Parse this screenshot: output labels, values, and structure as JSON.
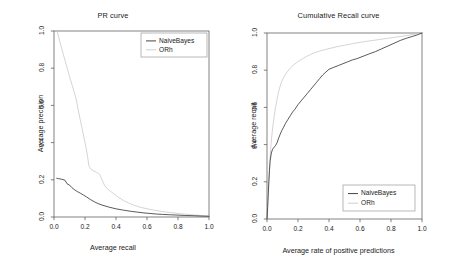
{
  "figure": {
    "background": "#ffffff",
    "panels": [
      "pr",
      "cumrecall"
    ]
  },
  "colors": {
    "naivebayes": "#303030",
    "orh": "#c9c9c9",
    "axis": "#4d4d4d",
    "text": "#1a1a1a",
    "legend_border": "#9a9a9a"
  },
  "chart_data": [
    {
      "id": "pr",
      "type": "line",
      "title": "PR curve",
      "xlabel": "Average recall",
      "ylabel": "Average precision",
      "xlim": [
        0.0,
        1.0
      ],
      "ylim": [
        0.0,
        1.0
      ],
      "xticks": [
        "0.0",
        "0.2",
        "0.4",
        "0.6",
        "0.8",
        "1.0"
      ],
      "yticks": [
        "0.0",
        "0.2",
        "0.4",
        "0.6",
        "0.8",
        "1.0"
      ],
      "grid": false,
      "legend_position": "top-right",
      "legend": [
        "NaiveBayes",
        "ORh"
      ],
      "series": [
        {
          "name": "NaiveBayes",
          "color": "#303030",
          "x": [
            0.018,
            0.03,
            0.05,
            0.07,
            0.085,
            0.1,
            0.115,
            0.13,
            0.15,
            0.17,
            0.19,
            0.21,
            0.235,
            0.26,
            0.285,
            0.31,
            0.335,
            0.36,
            0.4,
            0.44,
            0.47,
            0.5,
            0.54,
            0.58,
            0.62,
            0.66,
            0.7,
            0.75,
            0.8,
            0.85,
            0.9,
            0.95,
            1.0
          ],
          "y": [
            0.208,
            0.206,
            0.203,
            0.198,
            0.178,
            0.172,
            0.158,
            0.148,
            0.137,
            0.128,
            0.118,
            0.108,
            0.094,
            0.082,
            0.072,
            0.064,
            0.058,
            0.052,
            0.044,
            0.038,
            0.034,
            0.03,
            0.026,
            0.022,
            0.019,
            0.016,
            0.014,
            0.012,
            0.01,
            0.008,
            0.007,
            0.005,
            0.004
          ]
        },
        {
          "name": "ORh",
          "color": "#c9c9c9",
          "x": [
            0.02,
            0.04,
            0.06,
            0.08,
            0.1,
            0.12,
            0.14,
            0.16,
            0.18,
            0.2,
            0.215,
            0.225,
            0.24,
            0.255,
            0.275,
            0.295,
            0.31,
            0.325,
            0.345,
            0.365,
            0.39,
            0.42,
            0.45,
            0.48,
            0.52,
            0.56,
            0.6,
            0.65,
            0.7,
            0.75,
            0.8,
            0.85,
            0.9,
            0.95,
            1.0
          ],
          "y": [
            1.0,
            0.935,
            0.875,
            0.815,
            0.755,
            0.7,
            0.645,
            0.56,
            0.48,
            0.4,
            0.335,
            0.275,
            0.255,
            0.248,
            0.24,
            0.228,
            0.2,
            0.172,
            0.15,
            0.138,
            0.122,
            0.104,
            0.088,
            0.076,
            0.062,
            0.052,
            0.044,
            0.036,
            0.029,
            0.024,
            0.019,
            0.015,
            0.011,
            0.008,
            0.005
          ]
        }
      ]
    },
    {
      "id": "cumrecall",
      "type": "line",
      "title": "Cumulative Recall curve",
      "xlabel": "Average rate of positive predictions",
      "ylabel": "Average recall",
      "xlim": [
        0.0,
        1.0
      ],
      "ylim": [
        0.0,
        1.0
      ],
      "xticks": [
        "0.0",
        "0.2",
        "0.4",
        "0.6",
        "0.8",
        "1.0"
      ],
      "yticks": [
        "0.0",
        "0.2",
        "0.4",
        "0.6",
        "0.8",
        "1.0"
      ],
      "grid": false,
      "legend_position": "bottom-right",
      "legend": [
        "NaiveBayes",
        "ORh"
      ],
      "series": [
        {
          "name": "NaiveBayes",
          "color": "#303030",
          "x": [
            0.0,
            0.004,
            0.008,
            0.012,
            0.016,
            0.02,
            0.028,
            0.036,
            0.045,
            0.055,
            0.065,
            0.075,
            0.085,
            0.095,
            0.105,
            0.12,
            0.135,
            0.15,
            0.165,
            0.18,
            0.2,
            0.22,
            0.24,
            0.26,
            0.28,
            0.3,
            0.32,
            0.34,
            0.36,
            0.38,
            0.4,
            0.43,
            0.46,
            0.49,
            0.52,
            0.55,
            0.58,
            0.62,
            0.66,
            0.7,
            0.74,
            0.78,
            0.82,
            0.86,
            0.9,
            0.94,
            0.97,
            1.0
          ],
          "y": [
            0.0,
            0.06,
            0.13,
            0.2,
            0.26,
            0.31,
            0.355,
            0.375,
            0.385,
            0.395,
            0.41,
            0.435,
            0.455,
            0.475,
            0.49,
            0.515,
            0.535,
            0.555,
            0.575,
            0.59,
            0.615,
            0.635,
            0.655,
            0.675,
            0.695,
            0.715,
            0.735,
            0.755,
            0.775,
            0.79,
            0.805,
            0.815,
            0.825,
            0.835,
            0.845,
            0.855,
            0.862,
            0.875,
            0.888,
            0.9,
            0.915,
            0.93,
            0.945,
            0.96,
            0.972,
            0.982,
            0.99,
            1.0
          ]
        },
        {
          "name": "ORh",
          "color": "#c9c9c9",
          "x": [
            0.0,
            0.004,
            0.008,
            0.013,
            0.018,
            0.024,
            0.03,
            0.038,
            0.046,
            0.055,
            0.065,
            0.075,
            0.085,
            0.095,
            0.11,
            0.125,
            0.14,
            0.155,
            0.17,
            0.19,
            0.21,
            0.23,
            0.25,
            0.28,
            0.31,
            0.34,
            0.38,
            0.42,
            0.46,
            0.5,
            0.55,
            0.6,
            0.65,
            0.7,
            0.75,
            0.8,
            0.85,
            0.9,
            0.95,
            1.0
          ],
          "y": [
            0.0,
            0.07,
            0.15,
            0.23,
            0.31,
            0.38,
            0.44,
            0.5,
            0.55,
            0.6,
            0.645,
            0.685,
            0.715,
            0.74,
            0.765,
            0.785,
            0.8,
            0.815,
            0.828,
            0.84,
            0.852,
            0.862,
            0.872,
            0.884,
            0.895,
            0.903,
            0.912,
            0.92,
            0.928,
            0.934,
            0.942,
            0.95,
            0.956,
            0.962,
            0.968,
            0.974,
            0.98,
            0.986,
            0.993,
            1.0
          ]
        }
      ]
    }
  ]
}
